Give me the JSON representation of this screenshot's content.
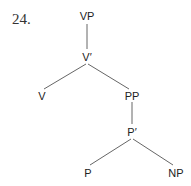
{
  "example_number": "24.",
  "tree": {
    "nodes": [
      {
        "id": "vp",
        "label": "VP"
      },
      {
        "id": "vbar",
        "label": "V′"
      },
      {
        "id": "v",
        "label": "V"
      },
      {
        "id": "pp",
        "label": "PP"
      },
      {
        "id": "pbar",
        "label": "P′"
      },
      {
        "id": "p",
        "label": "P"
      },
      {
        "id": "np",
        "label": "NP"
      }
    ],
    "edges": [
      [
        "vp",
        "vbar"
      ],
      [
        "vbar",
        "v"
      ],
      [
        "vbar",
        "pp"
      ],
      [
        "pp",
        "pbar"
      ],
      [
        "pbar",
        "p"
      ],
      [
        "pbar",
        "np"
      ]
    ]
  }
}
